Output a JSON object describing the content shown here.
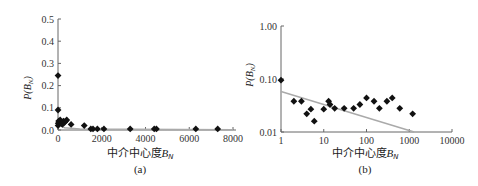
{
  "chart_data": [
    {
      "type": "scatter",
      "panel": "(a)",
      "title": "",
      "xlabel": "中介中心度B_N",
      "ylabel": "P(B_N)",
      "xlim": [
        0,
        8000
      ],
      "ylim": [
        0,
        0.5
      ],
      "x_ticks": [
        "0",
        "2000",
        "4000",
        "6000",
        "8000"
      ],
      "y_ticks": [
        "0.0",
        "0.1",
        "0.2",
        "0.3",
        "0.4",
        "0.5"
      ],
      "grid": false,
      "legend": null,
      "series": [
        {
          "name": "P(B_N)",
          "marker": "diamond",
          "x": [
            1,
            2,
            4,
            10,
            30,
            60,
            100,
            150,
            200,
            250,
            300,
            350,
            400,
            600,
            1200,
            1500,
            1600,
            1800,
            2100,
            3300,
            4400,
            4500,
            6300,
            7300
          ],
          "y": [
            0.245,
            0.09,
            0.02,
            0.03,
            0.04,
            0.035,
            0.045,
            0.03,
            0.025,
            0.04,
            0.035,
            0.04,
            0.045,
            0.025,
            0.02,
            0.005,
            0.005,
            0.005,
            0.005,
            0.005,
            0.005,
            0.005,
            0.005,
            0.005
          ]
        },
        {
          "name": "fit",
          "type": "line",
          "color": "#aaaaaa",
          "x": [
            0,
            100,
            300,
            1000,
            8000
          ],
          "y": [
            0.06,
            0.02,
            0.01,
            0.004,
            0.001
          ]
        }
      ]
    },
    {
      "type": "scatter",
      "panel": "(b)",
      "title": "",
      "xlabel": "中介中心度B_N",
      "ylabel": "P(B_N)",
      "xscale": "log",
      "yscale": "log",
      "xlim": [
        1,
        10000
      ],
      "ylim": [
        0.01,
        1.0
      ],
      "x_ticks": [
        "1",
        "10",
        "100",
        "1000",
        "10000"
      ],
      "y_ticks": [
        "0.01",
        "0.10",
        "1.00"
      ],
      "grid": false,
      "legend": null,
      "series": [
        {
          "name": "P(B_N)",
          "marker": "diamond",
          "x": [
            1,
            2,
            3,
            4,
            5,
            6,
            10,
            13,
            14,
            18,
            30,
            50,
            70,
            100,
            150,
            200,
            300,
            400,
            600,
            1200
          ],
          "y": [
            0.095,
            0.038,
            0.038,
            0.022,
            0.027,
            0.016,
            0.027,
            0.038,
            0.033,
            0.028,
            0.028,
            0.028,
            0.033,
            0.044,
            0.038,
            0.028,
            0.038,
            0.044,
            0.028,
            0.022
          ]
        },
        {
          "name": "power-law fit",
          "type": "line",
          "color": "#aaaaaa",
          "x": [
            1,
            1300
          ],
          "y": [
            0.058,
            0.01
          ]
        }
      ]
    }
  ],
  "panels": {
    "a": {
      "caption": "(a)",
      "xlabel_text": "中介中心度",
      "xlabel_var": "B",
      "xlabel_sub": "N",
      "ylabel_text": "P(B",
      "ylabel_sub": "N",
      "ylabel_close": ")",
      "yticks": [
        "0.5",
        "0.4",
        "0.3",
        "0.2",
        "0.1",
        "0.0"
      ],
      "xticks": [
        "0",
        "2000",
        "4000",
        "6000",
        "8000"
      ]
    },
    "b": {
      "caption": "(b)",
      "xlabel_text": "中介中心度",
      "xlabel_var": "B",
      "xlabel_sub": "N",
      "ylabel_text": "P(B",
      "ylabel_sub": "N",
      "ylabel_close": ")",
      "yticks": [
        "1.00",
        "0.10",
        "0.01"
      ],
      "xticks": [
        "1",
        "10",
        "100",
        "1000",
        "10000"
      ]
    }
  },
  "colors": {
    "marker": "#111111",
    "axis": "#666666",
    "fit_line": "#aaaaaa"
  }
}
